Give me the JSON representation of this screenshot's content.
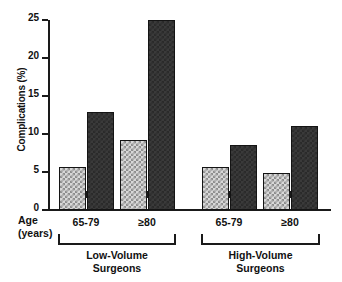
{
  "chart_data": {
    "type": "bar",
    "title": "",
    "xlabel": "Age (years)",
    "ylabel": "Complications (%)",
    "ylim": [
      0,
      25
    ],
    "yticks": [
      0,
      5,
      10,
      15,
      20,
      25
    ],
    "ytick_labels": [
      "0",
      "5",
      "10",
      "15",
      "20",
      "25"
    ],
    "grid": false,
    "legend": "none",
    "categories": [
      "65-79",
      "≥80",
      "65-79",
      "≥80"
    ],
    "groups": [
      {
        "label_line1": "Low-Volume",
        "label_line2": "Surgeons",
        "categories": [
          "65-79",
          "≥80"
        ]
      },
      {
        "label_line1": "High-Volume",
        "label_line2": "Surgeons",
        "categories": [
          "65-79",
          "≥80"
        ]
      }
    ],
    "series": [
      {
        "name": "light-checkered",
        "fill": "checkered",
        "color": "#d8d8d8",
        "values": [
          5.7,
          9.2,
          5.7,
          4.9
        ]
      },
      {
        "name": "dark-solid",
        "fill": "solid-dark",
        "color": "#3a3a3a",
        "values": [
          12.9,
          25.0,
          8.6,
          11.1
        ]
      }
    ]
  },
  "axis": {
    "y_label": "Complications (%)",
    "x_caption_line1": "Age",
    "x_caption_line2": "(years)"
  }
}
